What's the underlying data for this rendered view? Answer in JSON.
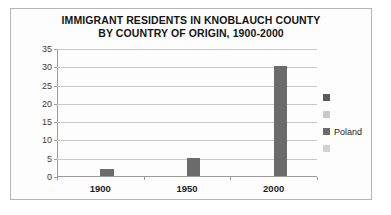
{
  "chart_data": {
    "type": "bar",
    "title": "IMMIGRANT RESIDENTS IN KNOBLAUCH COUNTY BY COUNTRY OF ORIGIN, 1900-2000",
    "title_lines": [
      "IMMIGRANT RESIDENTS IN KNOBLAUCH COUNTY",
      "BY COUNTRY OF ORIGIN, 1900-2000"
    ],
    "categories": [
      "1900",
      "1950",
      "2000"
    ],
    "series": [
      {
        "name": "",
        "values": [
          null,
          null,
          null
        ],
        "color": "#595959"
      },
      {
        "name": "",
        "values": [
          null,
          null,
          null
        ],
        "color": "#c9c9c9"
      },
      {
        "name": "Poland",
        "values": [
          2,
          5,
          30
        ],
        "color": "#6b6b6b"
      },
      {
        "name": "",
        "values": [
          null,
          null,
          null
        ],
        "color": "#d2d2d2"
      }
    ],
    "values": [
      2,
      5,
      30
    ],
    "xlabel": "",
    "ylabel": "",
    "ylim": [
      0,
      35
    ],
    "yticks": [
      "0",
      "5",
      "10",
      "15",
      "20",
      "25",
      "30",
      "35"
    ],
    "grid": true,
    "legend_position": "right",
    "legend_entries": [
      {
        "label": "",
        "color": "#595959"
      },
      {
        "label": "",
        "color": "#c9c9c9"
      },
      {
        "label": "Poland",
        "color": "#6b6b6b"
      },
      {
        "label": "",
        "color": "#d2d2d2"
      }
    ]
  }
}
